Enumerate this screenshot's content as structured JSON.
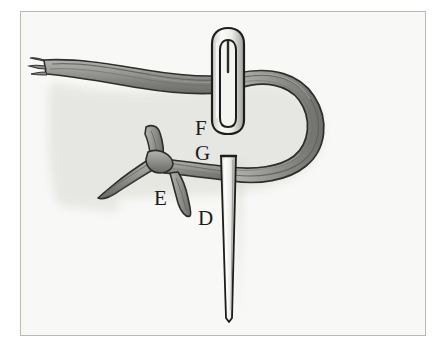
{
  "figure": {
    "style": "pen-and-ink hand drawing, grayscale",
    "frame": {
      "border_color": "#b9b9b6",
      "background_color": "#f8f8f6",
      "outer_background_color": "#ffffff"
    },
    "palette": {
      "thread_fill": "#8d8d8a",
      "thread_fill_light": "#a9a9a5",
      "thread_fill_dark": "#6f6f6c",
      "outline": "#2a2a28",
      "needle_fill": "#efefec",
      "needle_outline": "#202020",
      "shadow": "#dcdcd8",
      "label_color": "#1b1b1b"
    },
    "labels": [
      {
        "id": "F",
        "text": "F",
        "x": 195,
        "y": 118,
        "refers_to": "needle-eye-bottom"
      },
      {
        "id": "G",
        "text": "G",
        "x": 195,
        "y": 143,
        "refers_to": "needle-shaft-top"
      },
      {
        "id": "E",
        "text": "E",
        "x": 154,
        "y": 188,
        "refers_to": "thread-junction"
      },
      {
        "id": "D",
        "text": "D",
        "x": 198,
        "y": 208,
        "refers_to": "thread-loop-end"
      }
    ],
    "elements": [
      {
        "id": "thread-tail",
        "name": "twisted-thread-tail",
        "note": "frayed thread end entering from left edge"
      },
      {
        "id": "thread-loop",
        "name": "thread-loop",
        "note": "large D-shaped loop curving to the right"
      },
      {
        "id": "thread-junction",
        "name": "thread-y-junction",
        "note": "three-pronged Y crossing at left of centre"
      },
      {
        "id": "needle-eye",
        "name": "needle-eye",
        "note": "elongated oval eye at top of needle"
      },
      {
        "id": "needle-shaft",
        "name": "needle-shaft",
        "note": "tapered shaft ending in a point at bottom"
      }
    ]
  }
}
